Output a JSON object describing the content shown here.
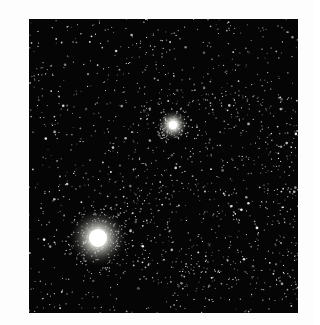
{
  "image": {
    "alt": "Star field with two bright star clusters",
    "background_color": "#050505",
    "frame": {
      "x": 29,
      "y": 19,
      "width": 269,
      "height": 294
    },
    "star_field": {
      "seed": 1337,
      "count": 1100,
      "dense_region": {
        "cx": 190,
        "cy": 170,
        "rx": 120,
        "ry": 110,
        "extra": 450
      }
    },
    "bright_objects": [
      {
        "name": "small-cluster",
        "cx": 144,
        "cy": 106,
        "core_radius": 4,
        "halo_radius": 16,
        "color": "#ffffff"
      },
      {
        "name": "large-cluster",
        "cx": 69,
        "cy": 219,
        "core_radius": 9,
        "halo_radius": 30,
        "color": "#ffffff"
      }
    ]
  }
}
